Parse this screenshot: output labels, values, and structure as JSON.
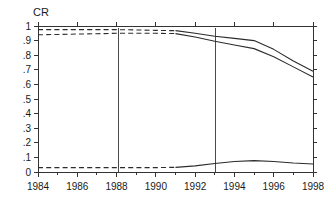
{
  "chart_data": {
    "type": "line",
    "title": "",
    "ylabel": "CR",
    "xlabel": "",
    "xlim": [
      1984,
      1998
    ],
    "ylim": [
      0,
      1
    ],
    "grid": false,
    "legend": "none",
    "y_ticks": [
      0,
      0.1,
      0.2,
      0.3,
      0.4,
      0.5,
      0.6,
      0.7,
      0.8,
      0.9,
      1
    ],
    "y_tick_labels": [
      "0",
      ".1",
      ".2",
      ".3",
      ".4",
      ".5",
      ".6",
      ".7",
      ".8",
      ".9",
      "1"
    ],
    "x_ticks": [
      1984,
      1986,
      1988,
      1990,
      1992,
      1994,
      1996,
      1998
    ],
    "x_tick_labels": [
      "1984",
      "1986",
      "1988",
      "1990",
      "1992",
      "1994",
      "1996",
      "1998"
    ],
    "x_minor_ticks": [
      1985,
      1987,
      1989,
      1991,
      1993,
      1995,
      1997
    ],
    "x": [
      1984,
      1985,
      1986,
      1987,
      1988,
      1989,
      1990,
      1991,
      1992,
      1993,
      1994,
      1995,
      1996,
      1997,
      1998
    ],
    "dashed_until_year": 1991,
    "series": [
      {
        "name": "upper",
        "style": "dashed-then-solid",
        "values": [
          0.975,
          0.975,
          0.975,
          0.975,
          0.975,
          0.973,
          0.97,
          0.968,
          0.95,
          0.93,
          0.915,
          0.9,
          0.84,
          0.76,
          0.69
        ]
      },
      {
        "name": "middle",
        "style": "dashed-then-solid",
        "values": [
          0.94,
          0.942,
          0.945,
          0.947,
          0.95,
          0.95,
          0.95,
          0.948,
          0.925,
          0.895,
          0.87,
          0.845,
          0.79,
          0.72,
          0.65
        ]
      },
      {
        "name": "lower",
        "style": "dashed-then-solid",
        "values": [
          0.03,
          0.03,
          0.03,
          0.03,
          0.03,
          0.03,
          0.03,
          0.032,
          0.042,
          0.058,
          0.072,
          0.078,
          0.072,
          0.062,
          0.055
        ]
      }
    ],
    "reference_lines": [
      {
        "name": "vline-1988",
        "x": 1988.1
      },
      {
        "name": "vline-1993",
        "x": 1993.05
      }
    ],
    "colors": {
      "axis": "#333333",
      "line": "#2b2b2b",
      "reference": "#4a4a4a",
      "background": "#ffffff"
    }
  }
}
